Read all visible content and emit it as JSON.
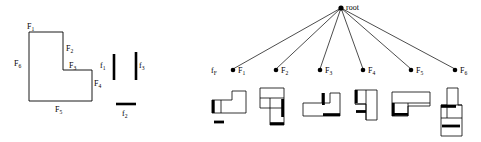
{
  "figure": {
    "caption": "",
    "panels": {
      "model_polygon": {
        "name": "model-polygon",
        "description": "L-shaped model polygon with six labelled boundary edges",
        "edge_labels": [
          "F1",
          "F2",
          "F3",
          "F4",
          "F5",
          "F6"
        ],
        "edge_label_text": [
          {
            "id": "F1",
            "base": "F",
            "sub": "1"
          },
          {
            "id": "F2",
            "base": "F",
            "sub": "2"
          },
          {
            "id": "F3",
            "base": "F",
            "sub": "3"
          },
          {
            "id": "F4",
            "base": "F",
            "sub": "4"
          },
          {
            "id": "F5",
            "base": "F",
            "sub": "5"
          },
          {
            "id": "F6",
            "base": "F",
            "sub": "6"
          }
        ],
        "vertices": "L-shape: top-left, top-right, step-in, step-down, bottom-right, bottom-left"
      },
      "feature_segments": {
        "name": "observed-feature-segments",
        "description": "Three detected edge segments from the sensed scene",
        "segments": [
          {
            "id": "f1",
            "base": "f",
            "sub": "1",
            "orientation": "vertical"
          },
          {
            "id": "f2",
            "base": "f",
            "sub": "2",
            "orientation": "horizontal"
          },
          {
            "id": "f3",
            "base": "f",
            "sub": "3",
            "orientation": "vertical"
          }
        ]
      },
      "interpretation_tree": {
        "name": "interpretation-tree",
        "root_label": "root",
        "level_label": {
          "base": "f",
          "sub": "F"
        },
        "children": [
          {
            "id": "F1",
            "base": "F",
            "sub": "1"
          },
          {
            "id": "F2",
            "base": "F",
            "sub": "2"
          },
          {
            "id": "F3",
            "base": "F",
            "sub": "3"
          },
          {
            "id": "F4",
            "base": "F",
            "sub": "4"
          },
          {
            "id": "F5",
            "base": "F",
            "sub": "5"
          },
          {
            "id": "F6",
            "base": "F",
            "sub": "6"
          }
        ],
        "hypothesis_shapes": [
          {
            "index": 1,
            "for_node": "F1",
            "description": "L-polygon with thick left edge and separate thick bar below"
          },
          {
            "index": 2,
            "for_node": "F2",
            "description": "stacked polygon with thick vertical right edge and thick bottom bar"
          },
          {
            "index": 3,
            "for_node": "F3",
            "description": "wide L-polygon with thick vertical notch and thick bottom-right bar"
          },
          {
            "index": 4,
            "for_node": "F4",
            "description": "polygon with thick upper-left vertical edge and thick short bar"
          },
          {
            "index": 5,
            "for_node": "F5",
            "description": "wide rectangle polygon with thick left edge and thick interior bar"
          },
          {
            "index": 6,
            "for_node": "F6",
            "description": "tall stacked polygon with thick horizontal cross bars"
          }
        ]
      }
    }
  },
  "colors": {
    "ink": "#000000",
    "paper": "#ffffff"
  }
}
